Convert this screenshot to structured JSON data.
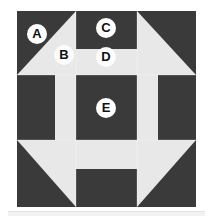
{
  "figure": {
    "background_color": "#ffffff",
    "dark_color": "#3a3a3a",
    "light_color": "#e8e8e8",
    "label_circle_color": "#ffffff",
    "label_text_color": "#111111",
    "block": {
      "name": "Churn Dash block",
      "x": 17,
      "y": 11,
      "width": 179,
      "height": 196,
      "grid_columns": 3,
      "grid_rows": 3,
      "column_edges": [
        0,
        59,
        120,
        179
      ],
      "row_edges": [
        0,
        64,
        129,
        196
      ]
    },
    "units": [
      {
        "id": "top-left-corner",
        "type": "half-square-triangle",
        "dark_corner": "top-left",
        "light_corner": "bottom-right"
      },
      {
        "id": "top-center-rail",
        "type": "two-bar-rail",
        "top_bar": "dark",
        "bottom_bar": "light"
      },
      {
        "id": "top-right-corner",
        "type": "half-square-triangle",
        "dark_corner": "top-right",
        "light_corner": "bottom-left"
      },
      {
        "id": "middle-left-rail",
        "type": "two-bar-rail",
        "left_bar": "dark",
        "right_bar": "light"
      },
      {
        "id": "center-square",
        "type": "solid-square",
        "fill": "dark"
      },
      {
        "id": "middle-right-rail",
        "type": "two-bar-rail",
        "left_bar": "light",
        "right_bar": "dark"
      },
      {
        "id": "bottom-left-corner",
        "type": "half-square-triangle",
        "dark_corner": "bottom-left",
        "light_corner": "top-right"
      },
      {
        "id": "bottom-center-rail",
        "type": "two-bar-rail",
        "top_bar": "light",
        "bottom_bar": "dark"
      },
      {
        "id": "bottom-right-corner",
        "type": "half-square-triangle",
        "dark_corner": "bottom-right",
        "light_corner": "top-left"
      }
    ],
    "labels": [
      {
        "id": "A",
        "text": "A",
        "x": 27,
        "y": 24,
        "on_background": "dark",
        "refers_to": "top-left-corner-dark-triangle"
      },
      {
        "id": "B",
        "text": "B",
        "x": 54,
        "y": 45,
        "on_background": "light",
        "refers_to": "top-left-corner-light-triangle"
      },
      {
        "id": "C",
        "text": "C",
        "x": 96,
        "y": 18,
        "on_background": "dark",
        "refers_to": "top-center-dark-bar"
      },
      {
        "id": "D",
        "text": "D",
        "x": 96,
        "y": 47,
        "on_background": "light",
        "refers_to": "top-center-light-bar"
      },
      {
        "id": "E",
        "text": "E",
        "x": 96,
        "y": 98,
        "on_background": "dark",
        "refers_to": "center-square"
      }
    ]
  }
}
